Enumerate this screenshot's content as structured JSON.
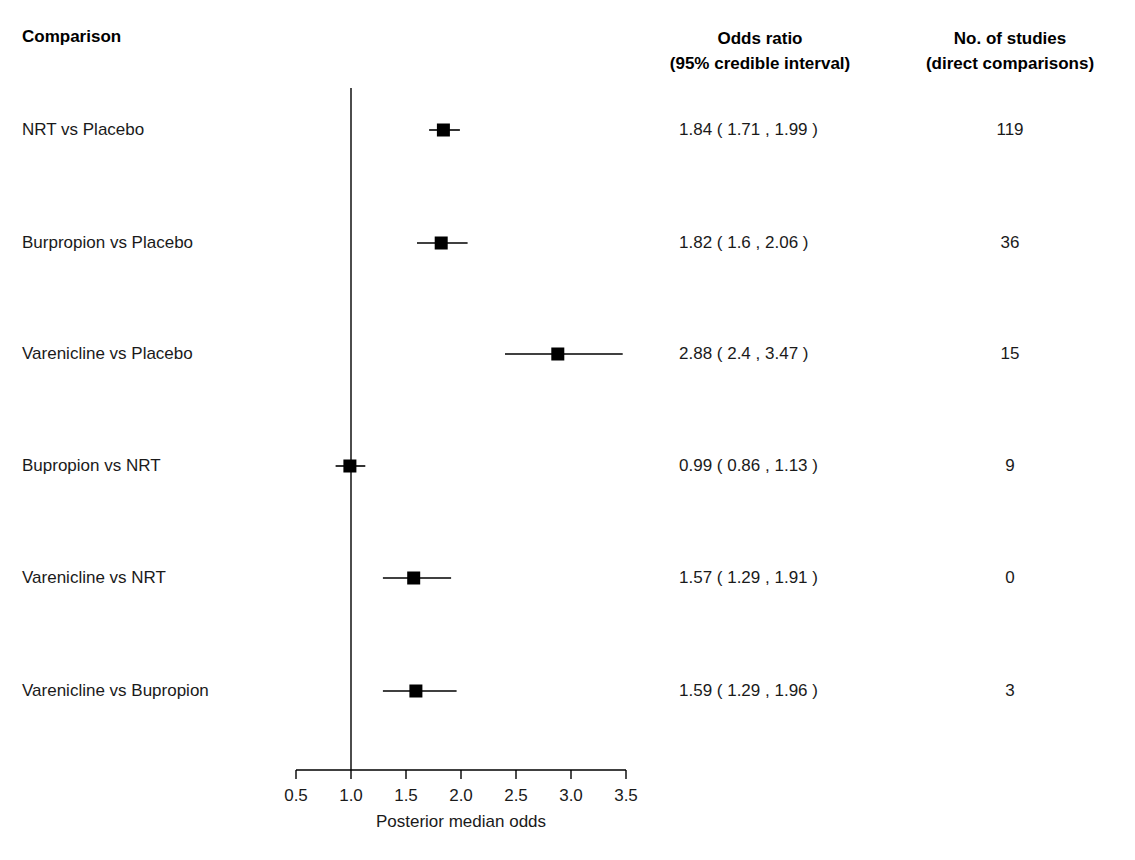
{
  "headers": {
    "comparison": "Comparison",
    "odds_ratio_line1": "Odds ratio",
    "odds_ratio_line2": "(95% credible interval)",
    "studies_line1": "No. of studies",
    "studies_line2": "(direct comparisons)"
  },
  "axis": {
    "title": "Posterior median odds",
    "ticks": [
      "0.5",
      "1.0",
      "1.5",
      "2.0",
      "2.5",
      "3.0",
      "3.5"
    ],
    "tick_values": [
      0.5,
      1.0,
      1.5,
      2.0,
      2.5,
      3.0,
      3.5
    ],
    "reference_line": 1.0
  },
  "colors": {
    "marker": "#000000",
    "line": "#000000",
    "text": "#1a1a1a",
    "background": "#ffffff"
  },
  "chart_data": {
    "type": "forest",
    "title": "",
    "xlabel": "Posterior median odds",
    "ylabel": "",
    "xlim": [
      0.5,
      3.5
    ],
    "grid": false,
    "reference_line": 1.0,
    "columns": [
      "Comparison",
      "Odds ratio (95% credible interval)",
      "No. of studies (direct comparisons)"
    ],
    "rows": [
      {
        "label": "NRT vs Placebo",
        "estimate": 1.84,
        "ci_low": 1.71,
        "ci_high": 1.99,
        "or_text": "1.84 ( 1.71 , 1.99 )",
        "studies": "119"
      },
      {
        "label": "Burpropion vs Placebo",
        "estimate": 1.82,
        "ci_low": 1.6,
        "ci_high": 2.06,
        "or_text": "1.82 ( 1.6 , 2.06 )",
        "studies": "36"
      },
      {
        "label": "Varenicline vs Placebo",
        "estimate": 2.88,
        "ci_low": 2.4,
        "ci_high": 3.47,
        "or_text": "2.88 ( 2.4 , 3.47 )",
        "studies": "15"
      },
      {
        "label": "Bupropion vs NRT",
        "estimate": 0.99,
        "ci_low": 0.86,
        "ci_high": 1.13,
        "or_text": "0.99 ( 0.86 , 1.13 )",
        "studies": "9"
      },
      {
        "label": "Varenicline vs NRT",
        "estimate": 1.57,
        "ci_low": 1.29,
        "ci_high": 1.91,
        "or_text": "1.57 ( 1.29 , 1.91 )",
        "studies": "0"
      },
      {
        "label": "Varenicline vs Bupropion",
        "estimate": 1.59,
        "ci_low": 1.29,
        "ci_high": 1.96,
        "or_text": "1.59 ( 1.29 , 1.96 )",
        "studies": "3"
      }
    ]
  }
}
